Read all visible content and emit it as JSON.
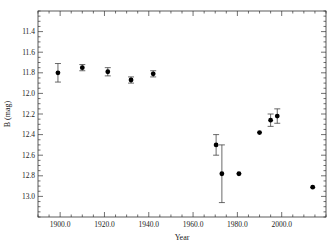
{
  "chart_data": {
    "type": "scatter",
    "title": "",
    "xlabel": "Year",
    "ylabel": "B (mag)",
    "xlim": [
      1890,
      2020
    ],
    "ylim": [
      11.2,
      13.2
    ],
    "y_inverted": true,
    "grid": false,
    "legend": "none",
    "xticks": [
      {
        "value": 1900,
        "label": "1900.0"
      },
      {
        "value": 1920,
        "label": "1920.0"
      },
      {
        "value": 1940,
        "label": "1940.0"
      },
      {
        "value": 1960,
        "label": "1960.0"
      },
      {
        "value": 1980,
        "label": "1980.0"
      },
      {
        "value": 2000,
        "label": "2000.0"
      }
    ],
    "yticks": [
      {
        "value": 11.4,
        "label": "11.4"
      },
      {
        "value": 11.6,
        "label": "11.6"
      },
      {
        "value": 11.8,
        "label": "11.8"
      },
      {
        "value": 12.0,
        "label": "12.0"
      },
      {
        "value": 12.2,
        "label": "12.2"
      },
      {
        "value": 12.4,
        "label": "12.4"
      },
      {
        "value": 12.6,
        "label": "12.6"
      },
      {
        "value": 12.8,
        "label": "12.8"
      },
      {
        "value": 13.0,
        "label": "13.0"
      }
    ],
    "series": [
      {
        "name": "B magnitude",
        "marker": "circle",
        "color": "#000000",
        "points": [
          {
            "x": 1899,
            "y": 11.8,
            "err": 0.09
          },
          {
            "x": 1910,
            "y": 11.75,
            "err": 0.03
          },
          {
            "x": 1921.5,
            "y": 11.79,
            "err": 0.04
          },
          {
            "x": 1932,
            "y": 11.87,
            "err": 0.03
          },
          {
            "x": 1942,
            "y": 11.81,
            "err": 0.03
          },
          {
            "x": 1970.4,
            "y": 12.5,
            "err": 0.1
          },
          {
            "x": 1973,
            "y": 12.78,
            "err": 0.28
          },
          {
            "x": 1980.7,
            "y": 12.78,
            "err": 0.0
          },
          {
            "x": 1990,
            "y": 12.38,
            "err": 0.0
          },
          {
            "x": 1995,
            "y": 12.26,
            "err": 0.06
          },
          {
            "x": 1998,
            "y": 12.22,
            "err": 0.07
          },
          {
            "x": 2014,
            "y": 12.91,
            "err": 0.0
          }
        ]
      }
    ]
  }
}
